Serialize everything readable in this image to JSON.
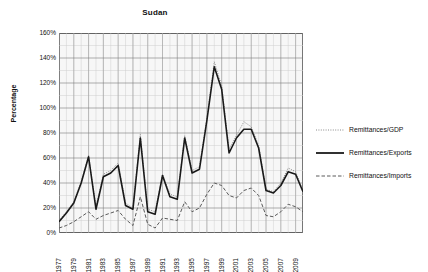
{
  "chart_data": {
    "type": "line",
    "title": "Sudan",
    "xlabel": "",
    "ylabel": "Percentage",
    "ylim": [
      0,
      160
    ],
    "ytick_values": [
      0,
      20,
      40,
      60,
      80,
      100,
      120,
      140,
      160
    ],
    "ytick_labels": [
      "0%",
      "20%",
      "40%",
      "60%",
      "80%",
      "100%",
      "120%",
      "140%",
      "160%"
    ],
    "grid": true,
    "legend_position": "right",
    "x": [
      1977,
      1978,
      1979,
      1980,
      1981,
      1982,
      1983,
      1984,
      1985,
      1986,
      1987,
      1988,
      1989,
      1990,
      1991,
      1992,
      1993,
      1994,
      1995,
      1996,
      1997,
      1998,
      1999,
      2000,
      2001,
      2002,
      2003,
      2004,
      2005,
      2006,
      2007,
      2008,
      2009,
      2010
    ],
    "xtick_labels": [
      "1977",
      "1979",
      "1981",
      "1983",
      "1985",
      "1987",
      "1989",
      "1991",
      "1993",
      "1995",
      "1997",
      "1999",
      "2001",
      "2003",
      "2005",
      "2007",
      "2009"
    ],
    "series": [
      {
        "name": "Remittances/GDP",
        "style": "dotted",
        "color": "#8a8a8a",
        "values": [
          10,
          17,
          25,
          41,
          62,
          21,
          47,
          50,
          56,
          24,
          20,
          79,
          19,
          17,
          47,
          31,
          29,
          78,
          50,
          53,
          92,
          137,
          118,
          67,
          78,
          89,
          85,
          70,
          35,
          33,
          40,
          52,
          49,
          34
        ]
      },
      {
        "name": "Remittances/Exports",
        "style": "solid",
        "color": "#1a1a1a",
        "values": [
          9,
          16,
          24,
          40,
          61,
          19,
          45,
          48,
          54,
          22,
          19,
          76,
          17,
          15,
          46,
          29,
          27,
          76,
          48,
          51,
          90,
          133,
          115,
          64,
          76,
          83,
          83,
          68,
          34,
          32,
          38,
          49,
          47,
          33
        ]
      },
      {
        "name": "Remittances/Imports",
        "style": "dashed",
        "color": "#5a5a5a",
        "values": [
          4,
          6,
          9,
          13,
          17,
          11,
          14,
          16,
          18,
          11,
          6,
          29,
          7,
          4,
          12,
          11,
          10,
          25,
          17,
          20,
          31,
          40,
          38,
          30,
          28,
          34,
          36,
          30,
          14,
          13,
          17,
          23,
          21,
          17
        ]
      }
    ]
  },
  "legend": {
    "items": [
      {
        "label": "Remittances/GDP"
      },
      {
        "label": "Remittances/Exports"
      },
      {
        "label": "Remittances/Imports"
      }
    ]
  }
}
